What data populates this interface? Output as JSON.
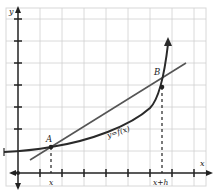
{
  "figure": {
    "type": "secant-line diagram",
    "axes": {
      "x_label": "x",
      "y_label": "y"
    },
    "curve": {
      "label": "y=f(x)"
    },
    "points": [
      {
        "name": "A",
        "x_label": "x"
      },
      {
        "name": "B",
        "x_label": "x+h"
      }
    ],
    "colors": {
      "curve": "#2a2a2a",
      "secant": "#555555",
      "grid": "#cfcfcf",
      "axis": "#222222"
    }
  }
}
